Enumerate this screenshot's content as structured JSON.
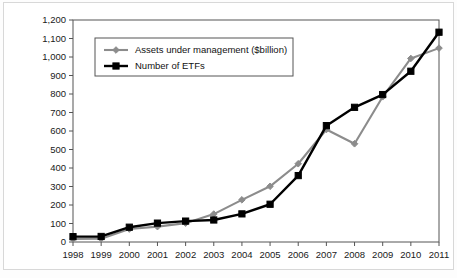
{
  "chart_data": {
    "type": "line",
    "title": "",
    "xlabel": "",
    "ylabel": "",
    "categories": [
      "1998",
      "1999",
      "2000",
      "2001",
      "2002",
      "2003",
      "2004",
      "2005",
      "2006",
      "2007",
      "2008",
      "2009",
      "2010",
      "2011"
    ],
    "ylim": [
      0,
      1200
    ],
    "ytick_values": [
      0,
      100,
      200,
      300,
      400,
      500,
      600,
      700,
      800,
      900,
      1000,
      1100,
      1200
    ],
    "ytick_labels": [
      "0",
      "100",
      "200",
      "300",
      "400",
      "500",
      "600",
      "700",
      "800",
      "900",
      "1,000",
      "1,100",
      "1,200"
    ],
    "grid": false,
    "legend_position": "upper-left",
    "series": [
      {
        "name": "Assets under management ($billion)",
        "color": "#8c8c8c",
        "marker": "diamond",
        "values": [
          16,
          18,
          70,
          83,
          102,
          151,
          228,
          301,
          423,
          608,
          531,
          785,
          992,
          1048
        ]
      },
      {
        "name": "Number of ETFs",
        "color": "#000000",
        "marker": "square",
        "values": [
          29,
          30,
          80,
          102,
          113,
          119,
          152,
          204,
          359,
          629,
          728,
          797,
          923,
          1134
        ]
      }
    ]
  },
  "legend": {
    "items": [
      {
        "label": "Assets under management ($billion)"
      },
      {
        "label": "Number of ETFs"
      }
    ]
  }
}
